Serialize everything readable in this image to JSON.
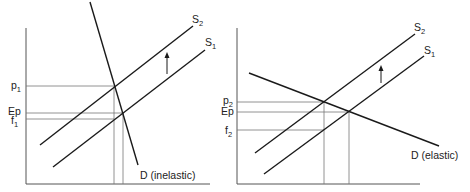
{
  "colors": {
    "curve": "#1a1a1a",
    "axis": "#555555",
    "guide": "#777777",
    "text": "#222222"
  },
  "left_panel": {
    "demand_label": "D (inelastic)",
    "supply_new": {
      "letter": "S",
      "sub": "2"
    },
    "supply_old": {
      "letter": "S",
      "sub": "1"
    },
    "y_labels": [
      {
        "letter": "p",
        "sub": "1"
      },
      {
        "letter": "Ep",
        "sub": ""
      },
      {
        "letter": "f",
        "sub": "1"
      }
    ]
  },
  "right_panel": {
    "demand_label": "D (elastic)",
    "supply_new": {
      "letter": "S",
      "sub": "2"
    },
    "supply_old": {
      "letter": "S",
      "sub": "1"
    },
    "y_labels": [
      {
        "letter": "p",
        "sub": "2"
      },
      {
        "letter": "Ep",
        "sub": ""
      },
      {
        "letter": "f",
        "sub": "2"
      }
    ]
  }
}
